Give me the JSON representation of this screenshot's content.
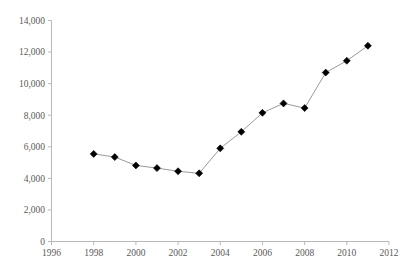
{
  "chart_data": {
    "type": "line",
    "title": "",
    "subtitle": "",
    "xlabel": "",
    "ylabel": "",
    "x": [
      1998,
      1999,
      2000,
      2001,
      2002,
      2003,
      2004,
      2005,
      2006,
      2007,
      2008,
      2009,
      2010,
      2011
    ],
    "values": [
      5550,
      5350,
      4820,
      4650,
      4450,
      4320,
      5900,
      6950,
      8150,
      8750,
      8450,
      10700,
      11450,
      12400
    ],
    "series": [
      {
        "name": "series-1",
        "values": [
          5550,
          5350,
          4820,
          4650,
          4450,
          4320,
          5900,
          6950,
          8150,
          8750,
          8450,
          10700,
          11450,
          12400
        ]
      }
    ],
    "xlim": [
      1996,
      2012
    ],
    "ylim": [
      0,
      14000
    ],
    "x_ticks": [
      1996,
      1998,
      2000,
      2002,
      2004,
      2006,
      2008,
      2010,
      2012
    ],
    "x_tick_labels": [
      "1996",
      "1998",
      "2000",
      "2002",
      "2004",
      "2006",
      "2008",
      "2010",
      "2012"
    ],
    "y_ticks": [
      0,
      2000,
      4000,
      6000,
      8000,
      10000,
      12000,
      14000
    ],
    "y_tick_labels": [
      "0",
      "2,000",
      "4,000",
      "6,000",
      "8,000",
      "10,000",
      "12,000",
      "14,000"
    ],
    "grid": false,
    "legend": false,
    "legend_position": "none",
    "marker": "diamond",
    "marker_color": "#000000",
    "line_color": "#9a9a9a",
    "axis_color": "#b8b8b8",
    "tick_label_color": "#5a5a57",
    "background_color": "#ffffff",
    "annotations": []
  }
}
